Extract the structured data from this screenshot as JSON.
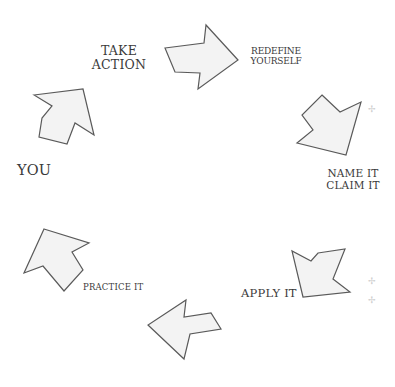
{
  "diagram": {
    "type": "cycle",
    "colors": {
      "arrow_fill": "#f3f3f3",
      "arrow_stroke": "#5a5a5a",
      "text": "#3a3a3a",
      "background": "#ffffff"
    },
    "labels": {
      "take_action": "TAKE\nACTION",
      "redefine_yourself": "REDEFINE\nYOURSELF",
      "you": "YOU",
      "name_it_claim_it": "NAME IT\nCLAIM IT",
      "apply_it": "APPLY  IT",
      "practice_it": "PRACTICE IT"
    },
    "sequence": [
      "YOU",
      "TAKE ACTION",
      "REDEFINE YOURSELF",
      "NAME IT CLAIM IT",
      "APPLY IT",
      "PRACTICE IT"
    ],
    "arrows": [
      {
        "name": "arrow-up-right",
        "direction": "up-right",
        "points": "34,95 83,89 94,135 75,123 67,144 39,137 42,118 52,106"
      },
      {
        "name": "arrow-right",
        "direction": "right",
        "points": "165,48 204,43 206,25 238,60 198,89 200,73 175,72"
      },
      {
        "name": "arrow-down-right",
        "direction": "down-right",
        "points": "322,95 340,112 361,102 346,155 297,143 313,130 302,115"
      },
      {
        "name": "arrow-down-left",
        "direction": "down-left",
        "points": "318,253 345,249 333,279 350,292 303,297 292,251 311,261"
      },
      {
        "name": "arrow-left",
        "direction": "left",
        "points": "186,300 184,317 211,313 221,329 190,334 184,359 148,325"
      },
      {
        "name": "arrow-up-left",
        "direction": "up-left",
        "points": "44,229 89,243 72,252 83,270 64,291 43,266 24,273"
      }
    ]
  }
}
